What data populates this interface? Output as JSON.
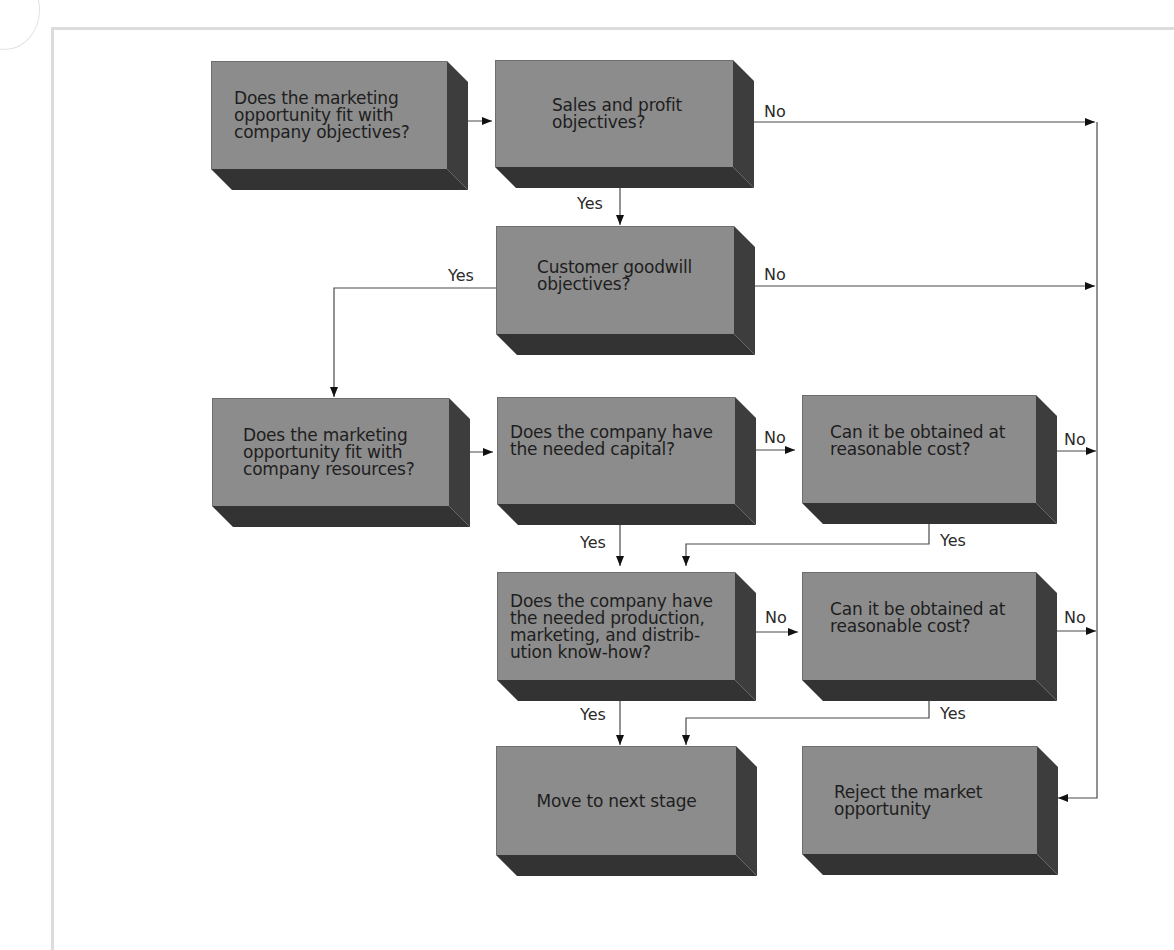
{
  "diagram": {
    "type": "flowchart",
    "colors": {
      "box_face": "#8c8c8c",
      "box_depth": "#3a3a3a",
      "line": "#444444",
      "background": "#ffffff"
    },
    "nodes": [
      {
        "id": "n1",
        "text": "Does the marketing\nopportunity fit with\ncompany objectives?"
      },
      {
        "id": "n2",
        "text": "Sales and profit\nobjectives?"
      },
      {
        "id": "n3",
        "text": "Customer goodwill\nobjectives?"
      },
      {
        "id": "n4",
        "text": "Does the marketing\nopportunity fit with\ncompany resources?"
      },
      {
        "id": "n5",
        "text": "Does the company have\nthe needed capital?"
      },
      {
        "id": "n6",
        "text": "Can it be obtained at\nreasonable cost?"
      },
      {
        "id": "n7",
        "text": "Does the company have\nthe needed production,\nmarketing, and distrib-\nution know-how?"
      },
      {
        "id": "n8",
        "text": "Can it be obtained at\nreasonable cost?"
      },
      {
        "id": "n9",
        "text": "Move to next stage"
      },
      {
        "id": "n10",
        "text": "Reject the market\nopportunity"
      }
    ],
    "edge_labels": {
      "n2_no": "No",
      "n2_yes": "Yes",
      "n3_yes": "Yes",
      "n3_no": "No",
      "n5_no": "No",
      "n5_yes": "Yes",
      "n6_no": "No",
      "n6_yes": "Yes",
      "n7_no": "No",
      "n7_yes": "Yes",
      "n8_no": "No",
      "n8_yes": "Yes"
    },
    "edges": [
      {
        "from": "n1",
        "to": "n2",
        "label": ""
      },
      {
        "from": "n2",
        "to": "n10",
        "label": "No"
      },
      {
        "from": "n2",
        "to": "n3",
        "label": "Yes"
      },
      {
        "from": "n3",
        "to": "n4",
        "label": "Yes"
      },
      {
        "from": "n3",
        "to": "n10",
        "label": "No"
      },
      {
        "from": "n4",
        "to": "n5",
        "label": ""
      },
      {
        "from": "n5",
        "to": "n6",
        "label": "No"
      },
      {
        "from": "n5",
        "to": "n7",
        "label": "Yes"
      },
      {
        "from": "n6",
        "to": "n10",
        "label": "No"
      },
      {
        "from": "n6",
        "to": "n7",
        "label": "Yes"
      },
      {
        "from": "n7",
        "to": "n8",
        "label": "No"
      },
      {
        "from": "n7",
        "to": "n9",
        "label": "Yes"
      },
      {
        "from": "n8",
        "to": "n10",
        "label": "No"
      },
      {
        "from": "n8",
        "to": "n9",
        "label": "Yes"
      }
    ]
  }
}
